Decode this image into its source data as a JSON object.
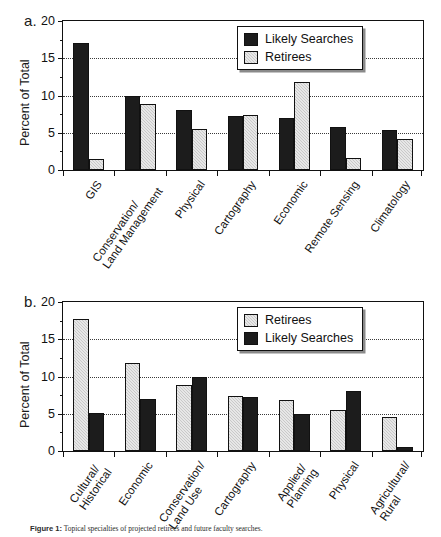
{
  "figure": {
    "caption_label": "Figure 1:",
    "caption_text": "Topical specialties of projected retirees and future faculty searches."
  },
  "panel_a": {
    "letter": "a.",
    "ylabel": "Percent of Total",
    "yticks": [
      "0",
      "5",
      "10",
      "15",
      "20"
    ],
    "legend": [
      {
        "label": "Likely Searches",
        "style": "dark"
      },
      {
        "label": "Retirees",
        "style": "light"
      }
    ]
  },
  "panel_b": {
    "letter": "b.",
    "ylabel": "Percent of Total",
    "yticks": [
      "0",
      "5",
      "10",
      "15",
      "20"
    ],
    "legend": [
      {
        "label": "Retirees",
        "style": "light"
      },
      {
        "label": "Likely Searches",
        "style": "dark"
      }
    ]
  },
  "chart_data": [
    {
      "id": "panel_a",
      "type": "bar",
      "title": "",
      "panel": "a.",
      "xlabel": "",
      "ylabel": "Percent of Total",
      "ylim": [
        0,
        20
      ],
      "yticks": [
        0,
        5,
        10,
        15,
        20
      ],
      "grid": "horizontal-dotted",
      "legend_position": "top-right",
      "categories": [
        "GIS",
        "Conservation/\nLand Management",
        "Physical",
        "Cartography",
        "Economic",
        "Remote Sensing",
        "Climatology"
      ],
      "series": [
        {
          "name": "Likely Searches",
          "style": "dark",
          "values": [
            17.1,
            9.9,
            8.0,
            7.2,
            7.0,
            5.8,
            5.4
          ]
        },
        {
          "name": "Retirees",
          "style": "light",
          "values": [
            1.5,
            8.9,
            5.5,
            7.4,
            11.8,
            1.6,
            4.1
          ]
        }
      ]
    },
    {
      "id": "panel_b",
      "type": "bar",
      "title": "",
      "panel": "b.",
      "xlabel": "",
      "ylabel": "Percent of Total",
      "ylim": [
        0,
        20
      ],
      "yticks": [
        0,
        5,
        10,
        15,
        20
      ],
      "grid": "horizontal-dotted",
      "legend_position": "top-right",
      "categories": [
        "Cultural/\nHistorical",
        "Economic",
        "Conservation/\nLand Use",
        "Cartography",
        "Applied/\nPlanning",
        "Physical",
        "Agricultural/\nRural"
      ],
      "series": [
        {
          "name": "Retirees",
          "style": "light",
          "values": [
            17.7,
            11.8,
            8.9,
            7.4,
            6.9,
            5.5,
            4.5
          ]
        },
        {
          "name": "Likely Searches",
          "style": "dark",
          "values": [
            5.1,
            7.0,
            9.9,
            7.2,
            5.0,
            8.0,
            0.6
          ]
        }
      ]
    }
  ]
}
